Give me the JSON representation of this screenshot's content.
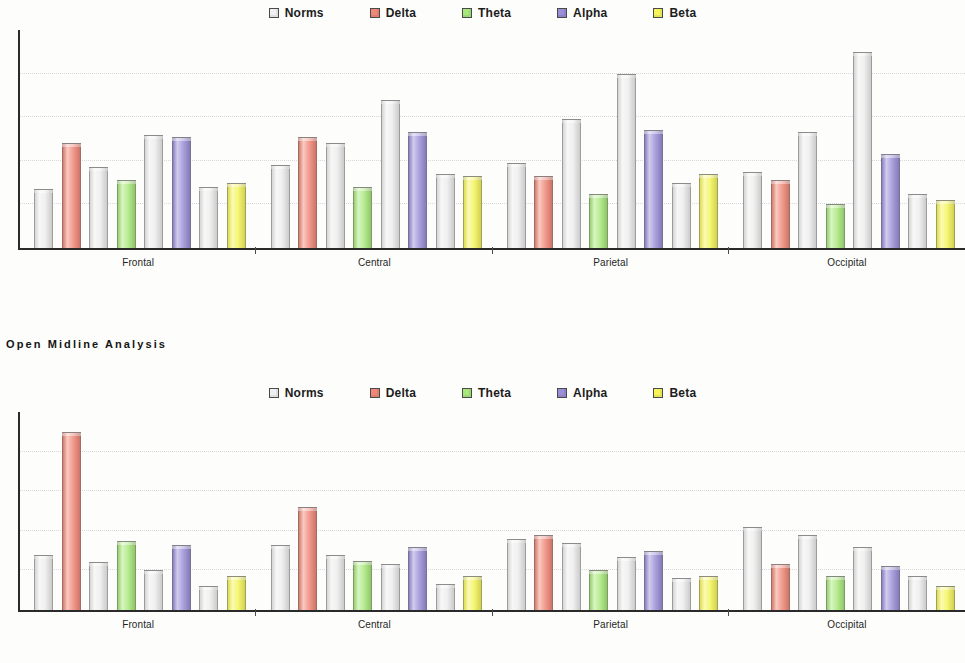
{
  "section_title": "Open Midline Analysis",
  "legend": {
    "items": [
      {
        "label": "Norms",
        "color": "#f0f0f0"
      },
      {
        "label": "Delta",
        "color": "#f08878"
      },
      {
        "label": "Theta",
        "color": "#a8e87a"
      },
      {
        "label": "Alpha",
        "color": "#9b8fd8"
      },
      {
        "label": "Beta",
        "color": "#f5f55a"
      }
    ]
  },
  "colors": {
    "norms": "#ededed",
    "delta": "#f08878",
    "theta": "#a8e87a",
    "alpha": "#9b8fd8",
    "beta": "#f5f55a",
    "axis": "#2a2a2a",
    "grid": "#d9d9d9"
  },
  "chart_data": [
    {
      "type": "bar",
      "title": "",
      "chart_id": "chart-1",
      "xlabel": "",
      "ylabel": "",
      "grid": true,
      "gridline_count": 4,
      "ylim": [
        0,
        100
      ],
      "legend_position": "top-center",
      "categories": [
        "Frontal",
        "Central",
        "Parietal",
        "Occipital"
      ],
      "bands": [
        "Delta",
        "Theta",
        "Alpha",
        "Beta"
      ],
      "series": [
        {
          "name": "Norms",
          "values": [
            [
              27,
              37,
              52,
              28
            ],
            [
              38,
              48,
              68,
              34
            ],
            [
              39,
              59,
              80,
              30
            ],
            [
              35,
              53,
              90,
              25
            ]
          ]
        },
        {
          "name": "Band",
          "values": [
            [
              48,
              31,
              51,
              30
            ],
            [
              51,
              28,
              53,
              33
            ],
            [
              33,
              25,
              54,
              34
            ],
            [
              31,
              20,
              43,
              22
            ]
          ]
        }
      ]
    },
    {
      "type": "bar",
      "title": "Open Midline Analysis",
      "chart_id": "chart-2",
      "xlabel": "",
      "ylabel": "",
      "grid": true,
      "gridline_count": 4,
      "ylim": [
        0,
        100
      ],
      "legend_position": "top-center",
      "categories": [
        "Frontal",
        "Central",
        "Parietal",
        "Occipital"
      ],
      "bands": [
        "Delta",
        "Theta",
        "Alpha",
        "Beta"
      ],
      "series": [
        {
          "name": "Norms",
          "values": [
            [
              28,
              24,
              20,
              12
            ],
            [
              33,
              28,
              23,
              13
            ],
            [
              36,
              34,
              27,
              16
            ],
            [
              42,
              38,
              32,
              17
            ]
          ]
        },
        {
          "name": "Band",
          "values": [
            [
              90,
              35,
              33,
              17
            ],
            [
              52,
              25,
              32,
              17
            ],
            [
              38,
              20,
              30,
              17
            ],
            [
              23,
              17,
              22,
              12
            ]
          ]
        }
      ]
    }
  ]
}
